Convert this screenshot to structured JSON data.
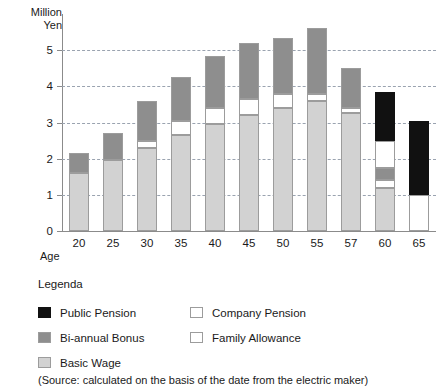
{
  "chart_data": {
    "type": "bar",
    "stacked": true,
    "title": "",
    "subtitle": "",
    "ylabel": "Million\nYen",
    "xlabel": "Age",
    "ylim": [
      0,
      6
    ],
    "yticks": [
      0,
      1,
      2,
      3,
      4,
      5
    ],
    "ytick_labels": [
      "0",
      "1",
      "2",
      "3",
      "4",
      "5"
    ],
    "grid": "horizontal-dashed",
    "legend_position": "below-plot",
    "legend_title": "Legenda",
    "categories": [
      "20",
      "25",
      "30",
      "35",
      "40",
      "45",
      "50",
      "55",
      "57",
      "60",
      "65"
    ],
    "series": [
      {
        "name": "Basic Wage",
        "color": "#d2d2d2",
        "values": [
          1.6,
          1.95,
          2.3,
          2.65,
          2.95,
          3.2,
          3.4,
          3.6,
          3.25,
          1.2,
          0.0
        ]
      },
      {
        "name": "Family Allowance",
        "color": "#ffffff",
        "values": [
          0.0,
          0.0,
          0.2,
          0.4,
          0.45,
          0.45,
          0.4,
          0.2,
          0.15,
          0.0,
          0.0
        ]
      },
      {
        "name": "Bi-annual Bonus",
        "color": "#8e8e8e",
        "values": [
          0.55,
          0.75,
          1.1,
          1.2,
          1.45,
          1.55,
          1.55,
          1.8,
          1.1,
          0.35,
          0.0
        ]
      },
      {
        "name": "Company Pension",
        "color": "#ffffff",
        "values": [
          0.0,
          0.0,
          0.0,
          0.0,
          0.0,
          0.0,
          0.0,
          0.0,
          0.0,
          0.95,
          1.0
        ]
      },
      {
        "name": "Public Pension",
        "color": "#111111",
        "values": [
          0.0,
          0.0,
          0.0,
          0.0,
          0.0,
          0.0,
          0.0,
          0.0,
          0.0,
          1.35,
          2.05
        ]
      }
    ],
    "totals": [
      2.15,
      2.7,
      3.6,
      4.25,
      4.85,
      5.2,
      5.35,
      5.6,
      4.5,
      4.05,
      3.05
    ],
    "bar_stack_order": [
      "Basic Wage",
      "Family Allowance",
      "Bi-annual Bonus",
      "Company Pension",
      "Public Pension"
    ],
    "bar_stack_order_age60": [
      "Basic Wage",
      "Company Pension",
      "Bi-annual Bonus",
      "Company Pension",
      "Public Pension"
    ],
    "source_note": "(Source: calculated on the basis of the date from the electric maker)"
  },
  "legend": {
    "title": "Legenda",
    "left_column": [
      {
        "label": "Public Pension",
        "swatch": "sw-public"
      },
      {
        "label": "Bi-annual Bonus",
        "swatch": "sw-bonus"
      },
      {
        "label": "Basic Wage",
        "swatch": "sw-basic"
      }
    ],
    "right_column": [
      {
        "label": "Company Pension",
        "swatch": "sw-company"
      },
      {
        "label": "Family Allowance",
        "swatch": "sw-family"
      }
    ]
  },
  "footer": {
    "source": "(Source: calculated on the basis of the date from the electric maker)"
  }
}
